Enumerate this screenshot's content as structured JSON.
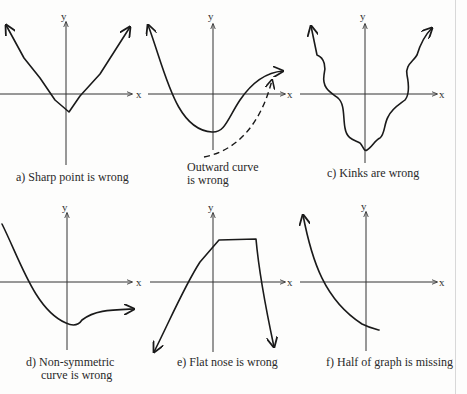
{
  "figure": {
    "axis_labels": {
      "x": "x",
      "y": "y"
    },
    "panels": [
      {
        "id": "a",
        "caption": "a)  Sharp point is wrong"
      },
      {
        "id": "b",
        "caption_line1": "Outward curve",
        "caption_line2": "is wrong"
      },
      {
        "id": "c",
        "caption": "c)  Kinks are wrong"
      },
      {
        "id": "d",
        "caption_line1": "d)  Non-symmetric",
        "caption_line2": "curve is wrong"
      },
      {
        "id": "e",
        "caption": "e)  Flat nose is wrong"
      },
      {
        "id": "f",
        "caption": "f)   Half of graph is missing"
      }
    ]
  }
}
